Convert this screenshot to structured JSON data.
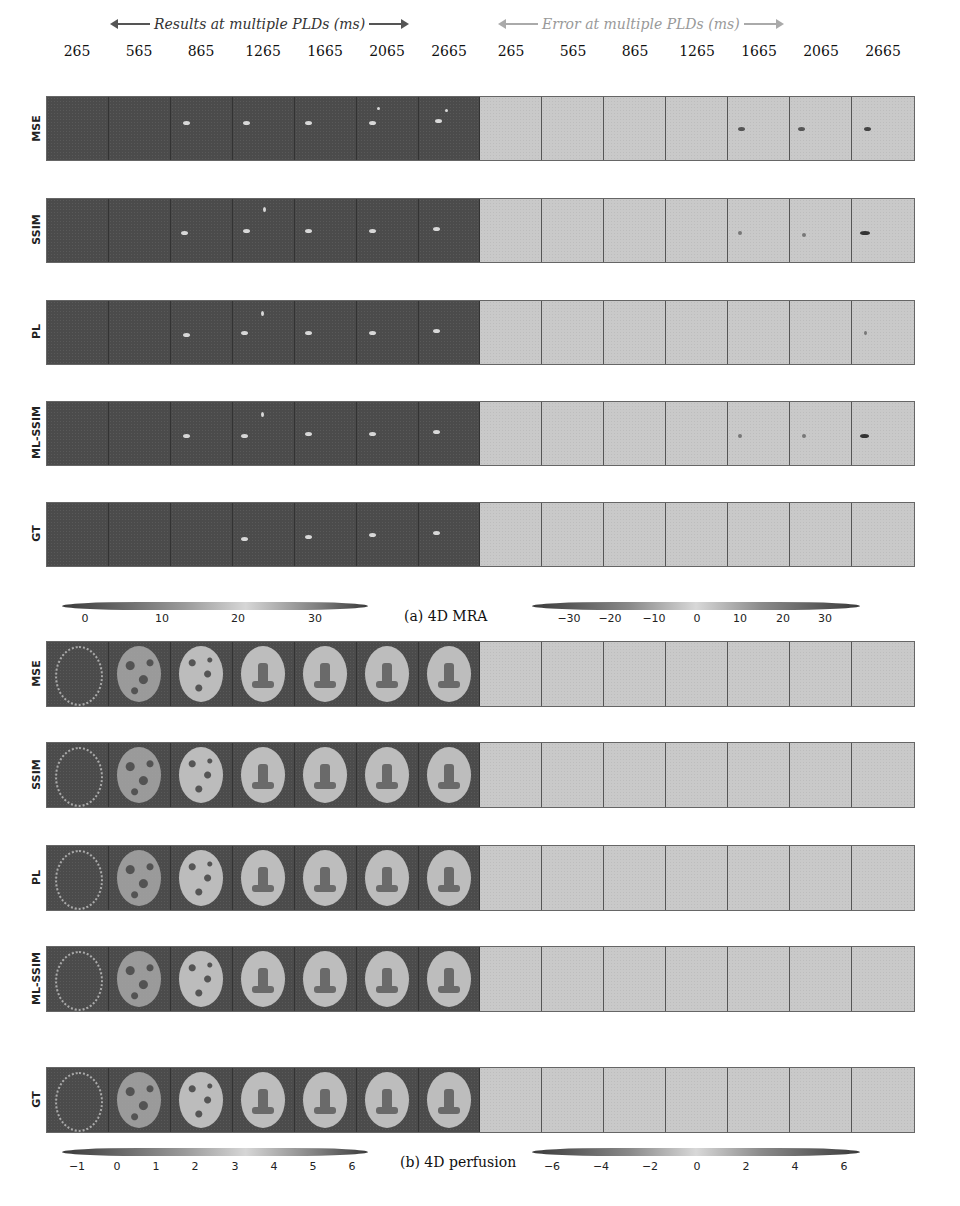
{
  "figure": {
    "header": {
      "results_title": "Results at multiple PLDs (ms)",
      "error_title": "Error at multiple PLDs (ms)",
      "plds_results": [
        "265",
        "565",
        "865",
        "1265",
        "1665",
        "2065",
        "2665"
      ],
      "plds_error": [
        "265",
        "565",
        "865",
        "1265",
        "1665",
        "2065",
        "2665"
      ]
    },
    "panel_a": {
      "caption": "(a) 4D MRA",
      "rows": [
        "MSE",
        "SSIM",
        "PL",
        "ML-SSIM",
        "GT"
      ],
      "colorbar_results": {
        "ticks": [
          "0",
          "10",
          "20",
          "30"
        ]
      },
      "colorbar_error": {
        "ticks": [
          "−30",
          "−20",
          "−10",
          "0",
          "10",
          "20",
          "30"
        ]
      }
    },
    "panel_b": {
      "caption": "(b) 4D perfusion",
      "rows": [
        "MSE",
        "SSIM",
        "PL",
        "ML-SSIM",
        "GT"
      ],
      "colorbar_results": {
        "ticks": [
          "−1",
          "0",
          "1",
          "2",
          "3",
          "4",
          "5",
          "6"
        ]
      },
      "colorbar_error": {
        "ticks": [
          "−6",
          "−4",
          "−2",
          "0",
          "2",
          "4",
          "6"
        ]
      }
    },
    "colors": {
      "result_background": "#4b4b4b",
      "error_background": "#c9c9c9",
      "brain_tissue": "#bdbdbd"
    }
  }
}
